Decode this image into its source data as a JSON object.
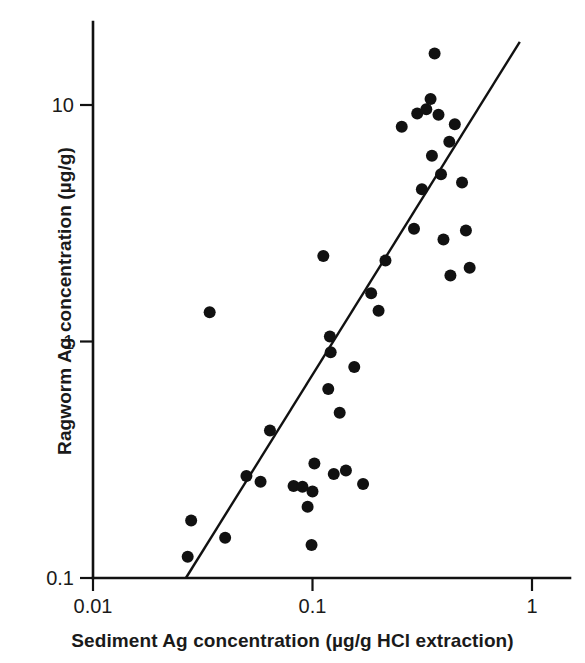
{
  "chart_data": {
    "type": "scatter",
    "title": "",
    "xlabel": "Sediment Ag concentration (µg/g HCl extraction)",
    "ylabel": "Ragworm Ag concentration (µg/g)",
    "xscale": "log",
    "yscale": "log",
    "xlim": [
      0.01,
      1.0
    ],
    "ylim": [
      0.1,
      20.0
    ],
    "grid": false,
    "legend": null,
    "xticks": [
      {
        "value": 0.01,
        "label": "0.01"
      },
      {
        "value": 0.1,
        "label": "0.1"
      },
      {
        "value": 1,
        "label": "1"
      }
    ],
    "yticks": [
      {
        "value": 0.1,
        "label": "0.1"
      },
      {
        "value": 1,
        "label": "1"
      },
      {
        "value": 10,
        "label": "10"
      }
    ],
    "marker": {
      "shape": "circle",
      "color": "#111111",
      "size": 7.2
    },
    "series": [
      {
        "name": "Ragworm vs sediment Ag",
        "points": [
          {
            "x": 0.027,
            "y": 0.123
          },
          {
            "x": 0.028,
            "y": 0.175
          },
          {
            "x": 0.034,
            "y": 1.33
          },
          {
            "x": 0.04,
            "y": 0.148
          },
          {
            "x": 0.05,
            "y": 0.27
          },
          {
            "x": 0.058,
            "y": 0.255
          },
          {
            "x": 0.064,
            "y": 0.42
          },
          {
            "x": 0.082,
            "y": 0.245
          },
          {
            "x": 0.09,
            "y": 0.243
          },
          {
            "x": 0.095,
            "y": 0.2
          },
          {
            "x": 0.099,
            "y": 0.138
          },
          {
            "x": 0.1,
            "y": 0.232
          },
          {
            "x": 0.102,
            "y": 0.305
          },
          {
            "x": 0.112,
            "y": 2.3
          },
          {
            "x": 0.118,
            "y": 0.63
          },
          {
            "x": 0.12,
            "y": 1.05
          },
          {
            "x": 0.121,
            "y": 0.9
          },
          {
            "x": 0.125,
            "y": 0.275
          },
          {
            "x": 0.133,
            "y": 0.5
          },
          {
            "x": 0.142,
            "y": 0.285
          },
          {
            "x": 0.155,
            "y": 0.78
          },
          {
            "x": 0.17,
            "y": 0.25
          },
          {
            "x": 0.185,
            "y": 1.6
          },
          {
            "x": 0.2,
            "y": 1.35
          },
          {
            "x": 0.215,
            "y": 2.2
          },
          {
            "x": 0.255,
            "y": 8.1
          },
          {
            "x": 0.29,
            "y": 3.0
          },
          {
            "x": 0.3,
            "y": 9.2
          },
          {
            "x": 0.315,
            "y": 4.4
          },
          {
            "x": 0.33,
            "y": 9.6
          },
          {
            "x": 0.345,
            "y": 10.6
          },
          {
            "x": 0.35,
            "y": 6.1
          },
          {
            "x": 0.36,
            "y": 16.5
          },
          {
            "x": 0.375,
            "y": 9.1
          },
          {
            "x": 0.385,
            "y": 5.1
          },
          {
            "x": 0.395,
            "y": 2.7
          },
          {
            "x": 0.42,
            "y": 7.0
          },
          {
            "x": 0.425,
            "y": 1.9
          },
          {
            "x": 0.445,
            "y": 8.3
          },
          {
            "x": 0.48,
            "y": 4.7
          },
          {
            "x": 0.5,
            "y": 2.95
          },
          {
            "x": 0.52,
            "y": 2.05
          }
        ]
      }
    ],
    "fit_line": {
      "type": "linear-on-log-log",
      "x_start": 0.0265,
      "y_start": 0.1,
      "x_end": 0.88,
      "y_end": 18.5
    }
  }
}
